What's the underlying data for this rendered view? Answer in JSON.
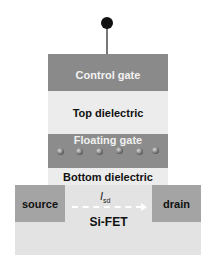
{
  "diagram": {
    "layers": {
      "control_gate": "Control gate",
      "top_dielectric": "Top dielectric",
      "floating_gate": "Floating gate",
      "bottom_dielectric": "Bottom dielectric",
      "substrate": "Si-FET"
    },
    "regions": {
      "source": "source",
      "drain": "drain"
    },
    "current": {
      "symbol": "I",
      "subscript": "sd"
    },
    "charge_dots": 6,
    "colors": {
      "gate": "#8a8a8a",
      "dielectric": "#ececec",
      "substrate": "#e3e3e3",
      "contact": "#a4a4a4",
      "terminal": "#111111"
    }
  }
}
